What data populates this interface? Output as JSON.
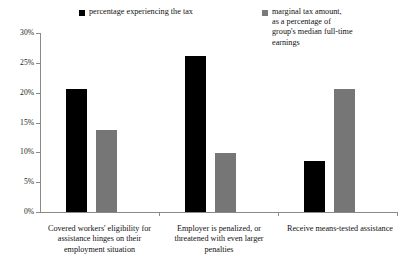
{
  "chart_data": {
    "type": "bar",
    "title": "",
    "xlabel": "",
    "ylabel": "",
    "ylim": [
      0,
      30
    ],
    "ytick_labels": [
      "0%",
      "5%",
      "10%",
      "15%",
      "20%",
      "25%",
      "30%"
    ],
    "ytick_values": [
      0,
      5,
      10,
      15,
      20,
      25,
      30
    ],
    "grid": false,
    "legend_position": "top",
    "categories": [
      "Covered workers' eligibility for\nassistance hinges on their\nemployment situation",
      "Employer is penalized, or\nthreatened with even larger\npenalties",
      "Receive means-tested assistance"
    ],
    "series": [
      {
        "name": "percentage experiencing the tax",
        "color": "#000000",
        "values": [
          20.6,
          26.1,
          8.5
        ]
      },
      {
        "name": "marginal tax amount,\nas a percentage of\ngroup's median full-time\nearnings",
        "color": "#767676",
        "values": [
          13.7,
          9.9,
          20.6
        ]
      }
    ]
  },
  "legend": {
    "entries": [
      {
        "label": "percentage experiencing the tax",
        "color": "#000000"
      },
      {
        "label": "marginal tax amount,\nas a percentage of\ngroup's median full-time\nearnings",
        "color": "#767676"
      }
    ]
  },
  "axis": {
    "y_labels": [
      "30%",
      "25%",
      "20%",
      "15%",
      "10%",
      "5%",
      "0%"
    ]
  }
}
